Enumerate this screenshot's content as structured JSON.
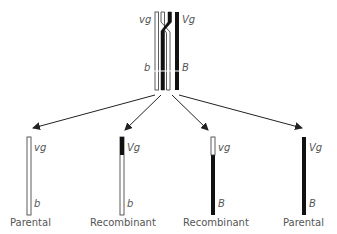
{
  "diagram": {
    "top": {
      "labels": {
        "left_top": "vg",
        "right_top": "Vg",
        "left_bottom": "b",
        "right_bottom": "B"
      }
    },
    "products": [
      {
        "top": "vg",
        "bottom": "b",
        "caption": "Parental",
        "type": "white"
      },
      {
        "top": "Vg",
        "bottom": "b",
        "caption": "Recombinant",
        "type": "black-top"
      },
      {
        "top": "vg",
        "bottom": "B",
        "caption": "Recombinant",
        "type": "white-top"
      },
      {
        "top": "Vg",
        "bottom": "B",
        "caption": "Parental",
        "type": "black"
      }
    ],
    "colors": {
      "dark": "#1a1a1a",
      "light": "#ffffff",
      "outline": "#333333",
      "text": "#555555"
    }
  }
}
